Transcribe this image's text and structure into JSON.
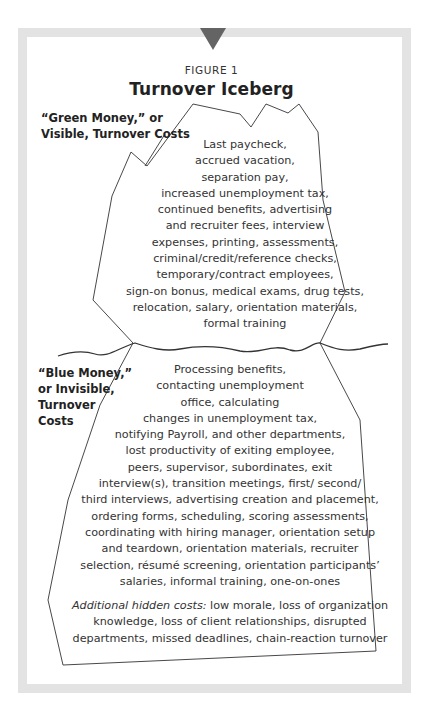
{
  "figure": {
    "label": "FIGURE 1",
    "title": "Turnover Iceberg"
  },
  "colors": {
    "frame": "#e3e3e3",
    "marker_triangle": "#646464",
    "line": "#333333"
  },
  "visible_section": {
    "heading_lines": [
      "“Green Money,” or",
      "Visible, Turnover Costs"
    ],
    "items_lines": [
      "Last paycheck,",
      "accrued vacation,",
      "separation pay,",
      "increased unemployment tax,",
      "continued benefits, advertising",
      "and recruiter fees, interview",
      "expenses, printing, assessments,",
      "criminal/credit/reference checks,",
      "temporary/contract employees,",
      "sign-on bonus, medical exams, drug tests,",
      "relocation, salary, orientation materials,",
      "formal training"
    ]
  },
  "hidden_section": {
    "heading_lines": [
      "“Blue Money,”",
      "or Invisible,",
      "Turnover",
      "Costs"
    ],
    "items_lines": [
      "Processing benefits,",
      "contacting unemployment",
      "office, calculating",
      "changes in unemployment tax,",
      "notifying Payroll, and other departments,",
      "lost productivity of exiting employee,",
      "peers, supervisor, subordinates, exit",
      "interview(s), transition meetings, first/ second/",
      "third interviews, advertising creation and placement,",
      "ordering forms, scheduling, scoring assessments,",
      "coordinating with hiring manager, orientation setup",
      "and teardown, orientation materials, recruiter",
      "selection, résumé screening, orientation participants’",
      "salaries, informal training, one-on-ones"
    ],
    "additional": {
      "label": "Additional hidden costs:",
      "first_line_rest": " low morale, loss of organization",
      "lines": [
        "knowledge, loss of client relationships, disrupted",
        "departments, missed deadlines, chain-reaction turnover"
      ]
    }
  }
}
